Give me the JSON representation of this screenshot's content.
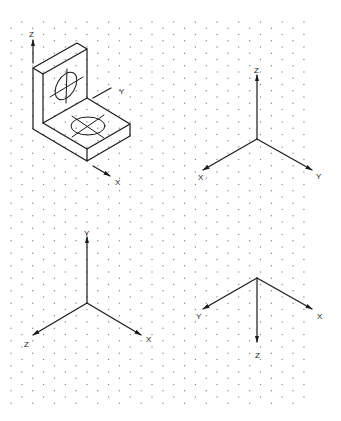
{
  "figure": {
    "background": "#ffffff",
    "line_color": "#1a1a1a",
    "dot_color": "#8a8a8a",
    "grid": {
      "type": "isometric-dot",
      "x_start": 11,
      "x_end": 311,
      "y_start": 22,
      "y_end": 405,
      "column_spacing": 10.85,
      "row_spacing": 12.5
    },
    "bracket": {
      "name": "L-bracket isometric view",
      "axes": {
        "z_label": "Z",
        "y_label": "Y",
        "x_label": "X"
      }
    },
    "axis_sets": [
      {
        "id": "top-right",
        "origin": [
          257,
          139
        ],
        "axes": [
          {
            "label": "Z",
            "tip": [
              257,
              75
            ],
            "label_pos": [
              254,
              73
            ]
          },
          {
            "label": "X",
            "tip": [
              203,
              170
            ],
            "label_pos": [
              198,
              180
            ]
          },
          {
            "label": "Y",
            "tip": [
              312,
              170
            ],
            "label_pos": [
              316,
              179
            ]
          }
        ]
      },
      {
        "id": "bottom-left",
        "origin": [
          87,
          303
        ],
        "axes": [
          {
            "label": "Y",
            "tip": [
              87,
              237
            ],
            "label_pos": [
              84,
              236
            ]
          },
          {
            "label": "Z",
            "tip": [
              33,
              335
            ],
            "label_pos": [
              24,
              347
            ]
          },
          {
            "label": "X",
            "tip": [
              141,
              335
            ],
            "label_pos": [
              146,
              342
            ]
          }
        ]
      },
      {
        "id": "bottom-right",
        "origin": [
          257,
          278
        ],
        "axes": [
          {
            "label": "Y",
            "tip": [
              203,
              309
            ],
            "label_pos": [
              196,
              319
            ]
          },
          {
            "label": "X",
            "tip": [
              312,
              309
            ],
            "label_pos": [
              317,
              319
            ]
          },
          {
            "label": "Z",
            "tip": [
              257,
              342
            ],
            "label_pos": [
              255,
              358
            ]
          }
        ]
      }
    ]
  }
}
